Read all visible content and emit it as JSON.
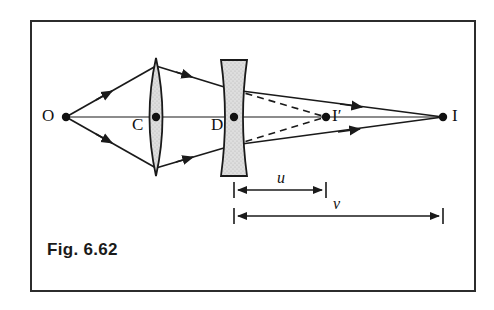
{
  "figure": {
    "caption": "Fig. 6.62",
    "frame": {
      "x": 30,
      "y": 20,
      "width": 446,
      "height": 272,
      "border_color": "#2c2c2c"
    }
  },
  "diagram": {
    "type": "ray-optics-two-lens",
    "background": "#ffffff",
    "ink_color": "#1a1a1a",
    "lens_fill": "#d9d9d9",
    "axis": {
      "y": 117,
      "x_start": 66,
      "x_end": 443
    },
    "points": [
      {
        "name": "object-point",
        "label": "O",
        "x": 66,
        "y": 117,
        "label_x": 42,
        "label_y": 106
      },
      {
        "name": "convex-lens-center",
        "label": "C",
        "x": 156,
        "y": 117,
        "label_x": 132,
        "label_y": 115
      },
      {
        "name": "concave-lens-center",
        "label": "D",
        "x": 234,
        "y": 117,
        "label_x": 211,
        "label_y": 115
      },
      {
        "name": "intermediate-image-point",
        "label": "I′",
        "x": 326,
        "y": 117,
        "label_x": 332,
        "label_y": 106
      },
      {
        "name": "final-image-point",
        "label": "I",
        "x": 443,
        "y": 117,
        "label_x": 452,
        "label_y": 106
      }
    ],
    "lenses": [
      {
        "name": "convex-lens",
        "kind": "converging",
        "center_x": 156,
        "top_y": 58,
        "bottom_y": 176,
        "half_thickness": 10
      },
      {
        "name": "concave-lens",
        "kind": "diverging",
        "center_x": 234,
        "top_y": 60,
        "bottom_y": 176,
        "half_width": 12,
        "waist": 5
      }
    ],
    "dimensions": [
      {
        "name": "object-distance-u",
        "label": "u",
        "x_start": 234,
        "x_end": 326,
        "y": 190,
        "label_x": 277,
        "label_y": 169
      },
      {
        "name": "image-distance-v",
        "label": "v",
        "x_start": 234,
        "x_end": 443,
        "y": 216,
        "label_x": 333,
        "label_y": 195
      }
    ],
    "rays": {
      "solid_description": "Rays from O through convex lens, refracted by concave lens, converging at I",
      "dashed_description": "Virtual/construction lines from concave lens edges to I′"
    }
  }
}
